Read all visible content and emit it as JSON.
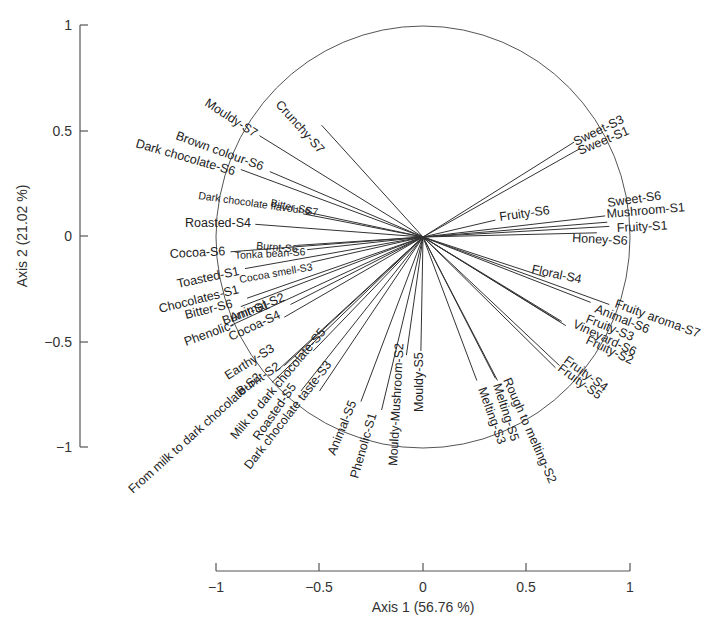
{
  "chart_data": {
    "type": "scatter",
    "subtype": "pca-correlation-circle",
    "title": "",
    "xlabel": "Axis 1 (56.76 %)",
    "ylabel": "Axis 2 (21.02 %)",
    "xlim": [
      -1,
      1
    ],
    "ylim": [
      -1,
      1
    ],
    "xticks": [
      "−1",
      "−0.5",
      "0",
      "0.5",
      "1"
    ],
    "yticks": [
      "1",
      "0.5",
      "0",
      "−0.5",
      "−1"
    ],
    "grid": false,
    "legend": null,
    "unit_circle": true,
    "vectors": [
      {
        "name": "Crunchy-S7",
        "x": -0.49,
        "y": 0.53
      },
      {
        "name": "Mouldy-S7",
        "x": -0.79,
        "y": 0.48
      },
      {
        "name": "Brown colour-S6",
        "x": -0.74,
        "y": 0.31
      },
      {
        "name": "Dark chocolate-S6",
        "x": -0.88,
        "y": 0.32
      },
      {
        "name": "Dark chocolate flavour-S7",
        "x": -0.57,
        "y": 0.12
      },
      {
        "name": "Bitter-S6",
        "x": -0.58,
        "y": 0.11
      },
      {
        "name": "Roasted-S4",
        "x": -0.81,
        "y": 0.06
      },
      {
        "name": "Burnt-S6",
        "x": -0.61,
        "y": -0.04
      },
      {
        "name": "Tonka bean-S6",
        "x": -0.56,
        "y": -0.06
      },
      {
        "name": "Cocoa-S6",
        "x": -0.93,
        "y": -0.07
      },
      {
        "name": "Cocoa smell-S3",
        "x": -0.54,
        "y": -0.12
      },
      {
        "name": "Toasted-S1",
        "x": -0.86,
        "y": -0.15
      },
      {
        "name": "Chocolates-S1",
        "x": -0.85,
        "y": -0.29
      },
      {
        "name": "Bitter-S6 ",
        "x": -0.88,
        "y": -0.33
      },
      {
        "name": "Burnt-S1",
        "x": -0.64,
        "y": -0.32
      },
      {
        "name": "Phenolic-Animal-S2",
        "x": -0.93,
        "y": -0.42
      },
      {
        "name": "Cocoa-S4",
        "x": -0.67,
        "y": -0.38
      },
      {
        "name": "Earthy-S3",
        "x": -0.67,
        "y": -0.61
      },
      {
        "name": "Burnt-S2",
        "x": -0.7,
        "y": -0.63
      },
      {
        "name": "From milk to dark chocolate-S2",
        "x": -0.73,
        "y": -0.69
      },
      {
        "name": "Milk to dark chocolate-S5",
        "x": -0.53,
        "y": -0.54
      },
      {
        "name": "Roasted-S5",
        "x": -0.59,
        "y": -0.73
      },
      {
        "name": "Dark chocolate taste-S3",
        "x": -0.5,
        "y": -0.73
      },
      {
        "name": "Animal-S5",
        "x": -0.3,
        "y": -0.78
      },
      {
        "name": "Phenolic-S1",
        "x": -0.2,
        "y": -0.82
      },
      {
        "name": "Mouldy-Mushroom-S2",
        "x": -0.08,
        "y": -0.56
      },
      {
        "name": "Mouldy-S5",
        "x": -0.01,
        "y": -0.54
      },
      {
        "name": "Melting-S3",
        "x": 0.26,
        "y": -0.68
      },
      {
        "name": "Melting-S5",
        "x": 0.35,
        "y": -0.67
      },
      {
        "name": "Rough to melting-S2",
        "x": 0.36,
        "y": -0.68
      },
      {
        "name": "Fruity-S4",
        "x": 0.66,
        "y": -0.61
      },
      {
        "name": "Fruity-S5",
        "x": 0.64,
        "y": -0.62
      },
      {
        "name": "Fruity-S3",
        "x": 0.66,
        "y": -0.4
      },
      {
        "name": "Vineyard-S6",
        "x": 0.67,
        "y": -0.4
      },
      {
        "name": "Fruity-S2",
        "x": 0.69,
        "y": -0.42
      },
      {
        "name": "Animal-S6",
        "x": 0.81,
        "y": -0.31
      },
      {
        "name": "Fruity aroma-S7",
        "x": 0.9,
        "y": -0.32
      },
      {
        "name": "Floral-S4",
        "x": 0.59,
        "y": -0.19
      },
      {
        "name": "Honey-S6",
        "x": 0.84,
        "y": 0.02
      },
      {
        "name": "Fruity-S1",
        "x": 0.9,
        "y": 0.05
      },
      {
        "name": "Mushroom-S1",
        "x": 0.89,
        "y": 0.07
      },
      {
        "name": "Sweet-S6",
        "x": 0.88,
        "y": 0.1
      },
      {
        "name": "Fruity-S6",
        "x": 0.35,
        "y": 0.08
      },
      {
        "name": "Sweet-S1",
        "x": 0.76,
        "y": 0.42
      },
      {
        "name": "Sweet-S3",
        "x": 0.73,
        "y": 0.45
      }
    ]
  },
  "axes": {
    "x_title": "Axis 1 (56.76 %)",
    "y_title": "Axis 2 (21.02 %)",
    "x_ticks": [
      "−1",
      "−0.5",
      "0",
      "0.5",
      "1"
    ],
    "y_ticks": [
      "1",
      "0.5",
      "0",
      "−0.5",
      "−1"
    ]
  },
  "labels": [
    {
      "text": "Crunchy-S7",
      "lx": 275,
      "ly": 105,
      "rot": 48,
      "size": "n"
    },
    {
      "text": "Mouldy-S7",
      "lx": 204,
      "ly": 105,
      "rot": 33,
      "size": "n"
    },
    {
      "text": "Brown colour-S6",
      "lx": 175,
      "ly": 139,
      "rot": 20,
      "size": "n"
    },
    {
      "text": "Dark chocolate-S6",
      "lx": 135,
      "ly": 147,
      "rot": 16,
      "size": "n"
    },
    {
      "text": "Dark chocolate flavour-S7",
      "lx": 198,
      "ly": 199,
      "rot": 8,
      "size": "s"
    },
    {
      "text": "Bitter-S6",
      "lx": 270,
      "ly": 206,
      "rot": 12,
      "size": "s"
    },
    {
      "text": "Roasted-S4",
      "lx": 185,
      "ly": 227,
      "rot": 0,
      "size": "n"
    },
    {
      "text": "Burnt-S6",
      "lx": 256,
      "ly": 249,
      "rot": 5,
      "size": "s"
    },
    {
      "text": "Tonka bean-S6",
      "lx": 235,
      "ly": 259,
      "rot": -3,
      "size": "s"
    },
    {
      "text": "Cocoa-S6",
      "lx": 170,
      "ly": 258,
      "rot": -3,
      "size": "n"
    },
    {
      "text": "Cocoa smell-S3",
      "lx": 240,
      "ly": 283,
      "rot": -10,
      "size": "s"
    },
    {
      "text": "Toasted-S1",
      "lx": 178,
      "ly": 288,
      "rot": -12,
      "size": "n"
    },
    {
      "text": "Chocolates-S1",
      "lx": 160,
      "ly": 313,
      "rot": -14,
      "size": "n"
    },
    {
      "text": "Bitter-S6",
      "lx": 186,
      "ly": 319,
      "rot": -14,
      "size": "n"
    },
    {
      "text": "Burnt-S1",
      "lx": 224,
      "ly": 325,
      "rot": -20,
      "size": "n"
    },
    {
      "text": "Animal-S2",
      "lx": 232,
      "ly": 322,
      "rot": -22,
      "size": "n"
    },
    {
      "text": "Phenolic-",
      "lx": 186,
      "ly": 346,
      "rot": -20,
      "size": "n"
    },
    {
      "text": "Cocoa-S4",
      "lx": 231,
      "ly": 341,
      "rot": -25,
      "size": "n"
    },
    {
      "text": "Earthy-S3",
      "lx": 228,
      "ly": 380,
      "rot": -32,
      "size": "n"
    },
    {
      "text": "Burnt-S2",
      "lx": 240,
      "ly": 396,
      "rot": -34,
      "size": "n"
    },
    {
      "text": "From milk to dark chocolate-S2",
      "lx": 133,
      "ly": 494,
      "rot": -42,
      "size": "n"
    },
    {
      "text": "Milk to dark chocolate-S5",
      "lx": 236,
      "ly": 440,
      "rot": -50,
      "size": "n"
    },
    {
      "text": "Roasted-S5",
      "lx": 259,
      "ly": 441,
      "rot": -55,
      "size": "n"
    },
    {
      "text": "Dark chocolate taste-S3",
      "lx": 250,
      "ly": 470,
      "rot": -52,
      "size": "n"
    },
    {
      "text": "Animal-S5",
      "lx": 335,
      "ly": 456,
      "rot": -68,
      "size": "n"
    },
    {
      "text": "Phenolic-S1",
      "lx": 358,
      "ly": 479,
      "rot": -74,
      "size": "n"
    },
    {
      "text": "Mouldy-Mushroom-S2",
      "lx": 397,
      "ly": 466,
      "rot": -87,
      "size": "n"
    },
    {
      "text": "Mouldy-S5",
      "lx": 423,
      "ly": 412,
      "rot": -90,
      "size": "n"
    },
    {
      "text": "Melting-S3",
      "lx": 478,
      "ly": 389,
      "rot": 70,
      "size": "n"
    },
    {
      "text": "Melting-S5",
      "lx": 493,
      "ly": 385,
      "rot": 72,
      "size": "n"
    },
    {
      "text": "Rough to melting-S2",
      "lx": 503,
      "ly": 380,
      "rot": 66,
      "size": "n"
    },
    {
      "text": "Fruity-S4",
      "lx": 563,
      "ly": 362,
      "rot": 36,
      "size": "n"
    },
    {
      "text": "Fruity-S5",
      "lx": 557,
      "ly": 370,
      "rot": 36,
      "size": "n"
    },
    {
      "text": "Fruity-S3",
      "lx": 585,
      "ly": 322,
      "rot": 22,
      "size": "n"
    },
    {
      "text": "Vineyard-S6",
      "lx": 572,
      "ly": 327,
      "rot": 25,
      "size": "n"
    },
    {
      "text": "Fruity-S2",
      "lx": 585,
      "ly": 343,
      "rot": 25,
      "size": "n"
    },
    {
      "text": "Animal-S6",
      "lx": 594,
      "ly": 312,
      "rot": 22,
      "size": "n"
    },
    {
      "text": "Fruity aroma-S7",
      "lx": 614,
      "ly": 307,
      "rot": 20,
      "size": "n"
    },
    {
      "text": "Floral-S4",
      "lx": 531,
      "ly": 273,
      "rot": 12,
      "size": "n"
    },
    {
      "text": "Honey-S6",
      "lx": 572,
      "ly": 242,
      "rot": 3,
      "size": "n"
    },
    {
      "text": "Fruity-S1",
      "lx": 617,
      "ly": 232,
      "rot": -3,
      "size": "n"
    },
    {
      "text": "Mushroom-S1",
      "lx": 607,
      "ly": 218,
      "rot": -5,
      "size": "n"
    },
    {
      "text": "Sweet-S6",
      "lx": 608,
      "ly": 207,
      "rot": -8,
      "size": "n"
    },
    {
      "text": "Fruity-S6",
      "lx": 500,
      "ly": 221,
      "rot": -8,
      "size": "n"
    },
    {
      "text": "Sweet-S1",
      "lx": 580,
      "ly": 155,
      "rot": -23,
      "size": "n"
    },
    {
      "text": "Sweet-S3",
      "lx": 576,
      "ly": 146,
      "rot": -26,
      "size": "n"
    }
  ]
}
